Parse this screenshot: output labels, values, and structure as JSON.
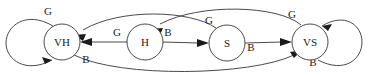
{
  "diagram": {
    "type": "state-transition-graph",
    "width": 368,
    "height": 76,
    "background_color": "#ffffff",
    "stroke_color": "#4a4a4a",
    "text_color": "#1a1a1a",
    "nodes": [
      {
        "id": "VH",
        "label": "VH",
        "cx": 62,
        "cy": 42,
        "r": 18
      },
      {
        "id": "H",
        "label": "H",
        "cx": 145,
        "cy": 42,
        "r": 18
      },
      {
        "id": "S",
        "label": "S",
        "cx": 227,
        "cy": 43,
        "r": 18
      },
      {
        "id": "VS",
        "label": "VS",
        "cx": 310,
        "cy": 42,
        "r": 18
      }
    ],
    "edges": [
      {
        "id": "vh-self",
        "from": "VH",
        "to": "VH",
        "label": "G",
        "label_x": 48,
        "label_y": 12,
        "kind": "self-loop-left"
      },
      {
        "id": "h-to-vh",
        "from": "H",
        "to": "VH",
        "label": "G",
        "label_x": 117,
        "label_y": 33,
        "kind": "straight"
      },
      {
        "id": "h-to-s",
        "from": "H",
        "to": "S",
        "label": "B",
        "label_x": 168,
        "label_y": 33,
        "kind": "straight"
      },
      {
        "id": "s-to-vs",
        "from": "S",
        "to": "VS",
        "label": "B",
        "label_x": 251,
        "label_y": 48,
        "kind": "straight"
      },
      {
        "id": "s-to-vh",
        "from": "S",
        "to": "VH",
        "label": "G",
        "label_x": 209,
        "label_y": 21,
        "kind": "arc-top"
      },
      {
        "id": "vs-to-h",
        "from": "VS",
        "to": "H",
        "label": "G",
        "label_x": 292,
        "label_y": 15,
        "kind": "arc-top"
      },
      {
        "id": "vh-to-vs",
        "from": "VH",
        "to": "VS",
        "label": "B",
        "label_x": 86,
        "label_y": 60,
        "kind": "arc-bottom"
      },
      {
        "id": "vs-self",
        "from": "VS",
        "to": "VS",
        "label": "B",
        "label_x": 313,
        "label_y": 63,
        "kind": "self-loop-right"
      }
    ],
    "legend_labels": {
      "good": "G",
      "bad": "B"
    }
  }
}
